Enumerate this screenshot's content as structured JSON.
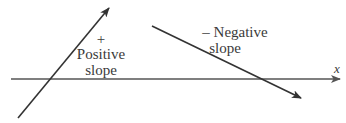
{
  "diagram": {
    "axis": {
      "label": "x",
      "color": "#555555"
    },
    "positive_line": {
      "sign": "+",
      "label_line1": "Positive",
      "label_line2": "slope",
      "color": "#333333"
    },
    "negative_line": {
      "label_line1": "– Negative",
      "label_line2": "slope",
      "color": "#333333"
    }
  }
}
